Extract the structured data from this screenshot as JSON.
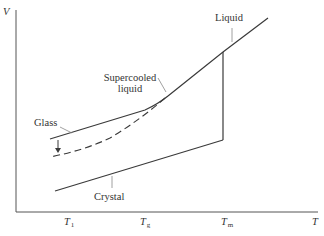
{
  "diagram": {
    "title": "",
    "axes": {
      "y_label": "V",
      "x_label": "T",
      "x_ticks": [
        {
          "main": "T",
          "sub": "1"
        },
        {
          "main": "T",
          "sub": "g"
        },
        {
          "main": "T",
          "sub": "m"
        }
      ]
    },
    "curves": [
      {
        "name": "Liquid",
        "style": "solid"
      },
      {
        "name": "Supercooled liquid",
        "style": "solid"
      },
      {
        "name": "Glass",
        "style": "solid"
      },
      {
        "name": "Glass (annealed)",
        "style": "dashed"
      },
      {
        "name": "Crystal",
        "style": "solid"
      }
    ],
    "labels": {
      "liquid": "Liquid",
      "supercooled_line1": "Supercooled",
      "supercooled_line2": "liquid",
      "glass": "Glass",
      "crystal": "Crystal"
    },
    "colors": {
      "line": "#3a3a3a",
      "axis": "#555555",
      "leader": "#888888"
    }
  }
}
